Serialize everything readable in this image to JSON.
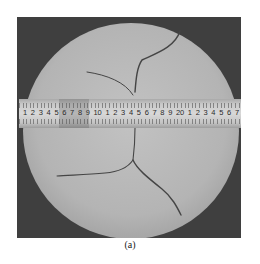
{
  "figure": {
    "label": "(a)",
    "colors": {
      "background": "#3f3f3f",
      "specimen": "#b9b9b9",
      "crack": "#444444",
      "ruler": "#d0d0d0"
    },
    "ruler": {
      "numbers": [
        "1",
        "2",
        "3",
        "4",
        "5",
        "6",
        "7",
        "8",
        "9",
        "10",
        "1",
        "2",
        "3",
        "4",
        "5",
        "6",
        "7",
        "8",
        "9",
        "20",
        "1",
        "2",
        "3",
        "4",
        "5",
        "6",
        "7"
      ]
    }
  }
}
